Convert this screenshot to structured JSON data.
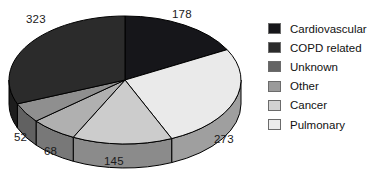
{
  "chart_data": {
    "type": "pie",
    "title": "",
    "three_d": true,
    "start_angle_deg": 0,
    "direction": "clockwise",
    "total": 1039,
    "categories": [
      "Cardiovascular",
      "Pulmonary",
      "Cancer",
      "Other",
      "Unknown",
      "COPD related"
    ],
    "values": [
      178,
      273,
      145,
      68,
      52,
      323
    ],
    "labels": [
      "178",
      "273",
      "145",
      "68",
      "52",
      "323"
    ],
    "colors": [
      "#16161a",
      "#eaeaea",
      "#cccccc",
      "#b0b0b0",
      "#8f8f8f",
      "#2b2b2b"
    ],
    "legend": {
      "position": "right",
      "entries": [
        {
          "label": "Cardiovascular",
          "color": "#16161a"
        },
        {
          "label": "COPD related",
          "color": "#2b2b2b"
        },
        {
          "label": "Unknown",
          "color": "#646464"
        },
        {
          "label": "Other",
          "color": "#9a9a9a"
        },
        {
          "label": "Cancer",
          "color": "#d2d2d2"
        },
        {
          "label": "Pulmonary",
          "color": "#ececec"
        }
      ]
    },
    "slice_label_positions": [
      {
        "text": "178",
        "x": 172,
        "y": 8
      },
      {
        "text": "273",
        "x": 214,
        "y": 133
      },
      {
        "text": "145",
        "x": 104,
        "y": 155
      },
      {
        "text": "68",
        "x": 44,
        "y": 145
      },
      {
        "text": "52",
        "x": 14,
        "y": 131
      },
      {
        "text": "323",
        "x": 26,
        "y": 13
      }
    ],
    "geometry": {
      "cx": 125,
      "cy": 80,
      "rx": 116,
      "ry": 64,
      "depth": 24,
      "outline_color": "#000000"
    },
    "xlabel": "",
    "ylabel": "",
    "grid": false
  }
}
